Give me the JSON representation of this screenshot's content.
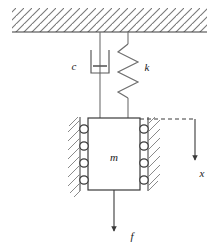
{
  "diagram": {
    "type": "mechanical-schematic",
    "colors": {
      "line": "#3a3a3a",
      "hatch": "#7a7a7a",
      "text": "#1a1a1a",
      "background": "#ffffff"
    },
    "labels": {
      "damper": "c",
      "spring": "k",
      "mass": "m",
      "displacement": "x",
      "force": "f"
    },
    "elements": {
      "ceiling": {
        "name": "fixed-support-ceiling",
        "hatch_angle_deg": 45,
        "x_start": 12,
        "x_end": 207,
        "y_top": 8,
        "y_baseline": 32
      },
      "damper": {
        "name": "damper",
        "rod_x": 100,
        "top_y": 32,
        "bottom_y": 118,
        "cylinder_top_y": 50,
        "cylinder_bottom_y": 73,
        "cylinder_half_width": 9,
        "piston_y": 66,
        "piston_half_width": 7,
        "label_x": 74,
        "label_y": 70
      },
      "spring": {
        "name": "spring",
        "anchor_x": 128,
        "top_y": 32,
        "coil_top_y": 44,
        "coil_bottom_y": 98,
        "bottom_y": 118,
        "coil_count": 5,
        "amplitude": 11,
        "label_x": 147,
        "label_y": 71
      },
      "mass_block": {
        "name": "mass-block",
        "x": 88,
        "y": 118,
        "width": 52,
        "height": 72,
        "label_x": 114,
        "label_y": 158
      },
      "rollers": {
        "name": "roller-bearings",
        "radius": 4.2,
        "left_cx": 84,
        "right_cx": 144,
        "cy_list": [
          129,
          146,
          163,
          180
        ]
      },
      "guide_walls": {
        "name": "guide-walls",
        "left_line_x": 80,
        "right_line_x": 148,
        "y_top": 118,
        "y_bottom": 190,
        "hatch_length": 13
      },
      "displacement_arrow": {
        "name": "displacement-arrow-x",
        "dash_y": 119,
        "dash_x_start": 140,
        "dash_x_end": 195,
        "arrow_x": 195,
        "arrow_y_start": 119,
        "arrow_y_end": 163,
        "label_x": 201,
        "label_y": 156
      },
      "force_arrow": {
        "name": "force-arrow-f",
        "x": 114,
        "y_start": 190,
        "y_end": 234,
        "label_x": 131,
        "label_y": 235
      }
    }
  }
}
